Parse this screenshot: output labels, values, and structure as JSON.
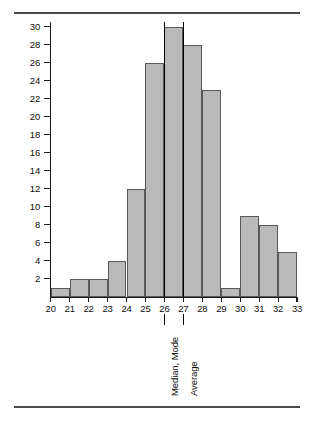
{
  "chart_data": {
    "type": "bar",
    "title": "",
    "subtitle": "",
    "xlabel": "",
    "ylabel": "Number of occurrences",
    "categories": [
      "20",
      "21",
      "22",
      "23",
      "24",
      "25",
      "26",
      "27",
      "28",
      "29",
      "30",
      "31",
      "32"
    ],
    "values": [
      1,
      2,
      2,
      4,
      12,
      26,
      30,
      28,
      23,
      1,
      9,
      8,
      5
    ],
    "bin_edges": [
      "20",
      "21",
      "22",
      "23",
      "24",
      "25",
      "26",
      "27",
      "28",
      "29",
      "30",
      "31",
      "32",
      "33"
    ],
    "xtick_labels": [
      "20",
      "21",
      "22",
      "23",
      "24",
      "25",
      "26",
      "27",
      "28",
      "29",
      "30",
      "31",
      "32",
      "33"
    ],
    "ytick_labels": [
      "2",
      "4",
      "6",
      "8",
      "10",
      "12",
      "14",
      "16",
      "18",
      "20",
      "22",
      "24",
      "26",
      "28",
      "30"
    ],
    "ytick_values": [
      2,
      4,
      6,
      8,
      10,
      12,
      14,
      16,
      18,
      20,
      22,
      24,
      26,
      28,
      30
    ],
    "ylim": [
      0,
      31
    ],
    "xlim": [
      20,
      33
    ],
    "grid": false,
    "legend": "none",
    "bar_fill_color": "#b9b9b9",
    "bar_border_color": "#585858",
    "axis_color": "#1a1a1a",
    "annotation_color": "#000000",
    "rule_color": "#4a4a4a",
    "annotations": [
      {
        "label": "Median, Mode",
        "x_value": 26
      },
      {
        "label": "Average",
        "x_value": 27
      }
    ]
  }
}
